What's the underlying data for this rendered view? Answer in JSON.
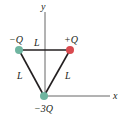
{
  "diagram": {
    "axes": {
      "y_label": "y",
      "x_label": "x"
    },
    "charges": [
      {
        "label": "−Q",
        "position": "top-left",
        "color": "#6fb5a0"
      },
      {
        "label": "+Q",
        "position": "top-right",
        "color": "#d94a4f"
      },
      {
        "label": "−3Q",
        "position": "bottom-origin",
        "color": "#6fb5a0"
      }
    ],
    "sides": [
      {
        "label": "L",
        "side": "top"
      },
      {
        "label": "L",
        "side": "left"
      },
      {
        "label": "L",
        "side": "right"
      }
    ],
    "colors": {
      "negative": "#6fb5a0",
      "positive": "#d94a4f",
      "line": "#231f20",
      "axis": "#555555"
    }
  }
}
